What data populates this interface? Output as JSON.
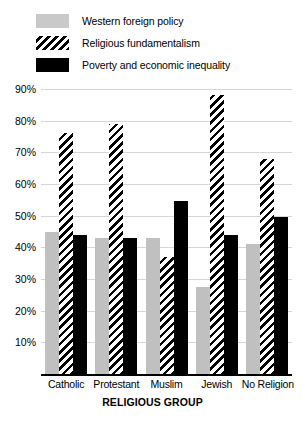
{
  "chart_data": {
    "type": "bar",
    "title": "",
    "subtitle": "",
    "xlabel": "RELIGIOUS GROUP",
    "ylabel": "",
    "categories": [
      "Catholic",
      "Protestant",
      "Muslim",
      "Jewish",
      "No Religion"
    ],
    "series": [
      {
        "name": "Western foreign policy",
        "swatch": "gray",
        "color": "#c0c0c0",
        "values": [
          45,
          43,
          43,
          27.5,
          41
        ]
      },
      {
        "name": "Religious fundamentalism",
        "swatch": "hatch",
        "color": "#000000",
        "values": [
          76,
          79,
          37,
          88,
          68
        ]
      },
      {
        "name": "Poverty and economic inequality",
        "swatch": "black",
        "color": "#000000",
        "values": [
          44,
          43,
          54.5,
          44,
          49.5
        ]
      }
    ],
    "ylim": [
      0,
      90
    ],
    "ytick_labels": [
      "90%",
      "80%",
      "70%",
      "60%",
      "50%",
      "40%",
      "30%",
      "20%",
      "10%"
    ],
    "ytick_values": [
      90,
      80,
      70,
      60,
      50,
      40,
      30,
      20,
      10
    ],
    "grid": true,
    "legend_position": "top-left",
    "value_format": "percent"
  },
  "legend": {
    "items": [
      {
        "label": "Western foreign policy",
        "swatch": "gray"
      },
      {
        "label": "Religious fundamentalism",
        "swatch": "hatch"
      },
      {
        "label": "Poverty and economic inequality",
        "swatch": "black"
      }
    ]
  },
  "axes": {
    "x_title": "RELIGIOUS GROUP"
  },
  "colors": {
    "gray": "#c0c0c0",
    "black": "#000000",
    "gridline": "#d6d6d6",
    "background": "#ffffff"
  }
}
